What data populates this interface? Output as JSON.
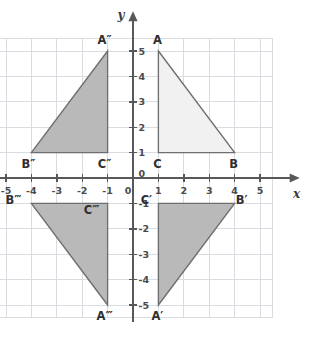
{
  "chart_data": {
    "type": "scatter",
    "title": "",
    "xlabel": "x",
    "ylabel": "y",
    "xlim": [
      -5.5,
      5.5
    ],
    "ylim": [
      -5.5,
      5.5
    ],
    "grid": true,
    "grid_step": 1,
    "legend": "none",
    "x_ticks": [
      "-5",
      "-4",
      "-3",
      "-2",
      "-1",
      "0",
      "1",
      "2",
      "3",
      "4",
      "5"
    ],
    "x_tick_values": [
      -5,
      -4,
      -3,
      -2,
      -1,
      0,
      1,
      2,
      3,
      4,
      5
    ],
    "y_ticks": [
      "-5",
      "-4",
      "-3",
      "-2",
      "-1",
      "0",
      "1",
      "2",
      "3",
      "4",
      "5"
    ],
    "y_tick_values": [
      -5,
      -4,
      -3,
      -2,
      -1,
      0,
      1,
      2,
      3,
      4,
      5
    ],
    "origin_label": "0",
    "shapes": [
      {
        "name": "triangle-abc",
        "role": "original",
        "fill": "#f1f1f1",
        "stroke": "#6e6e70",
        "vertices": [
          {
            "label": "A",
            "x": 1,
            "y": 5,
            "label_dx": -1,
            "label_dy": -7
          },
          {
            "label": "B",
            "x": 4,
            "y": 1,
            "label_dx": -1,
            "label_dy": 15
          },
          {
            "label": "C",
            "x": 1,
            "y": 1,
            "label_dx": -1,
            "label_dy": 15
          }
        ]
      },
      {
        "name": "triangle-a-prime",
        "role": "image",
        "fill": "#b9b9b9",
        "stroke": "#6e6e70",
        "vertices": [
          {
            "label": "A′",
            "x": 1,
            "y": -5,
            "label_dx": -1,
            "label_dy": 15
          },
          {
            "label": "B′",
            "x": 4,
            "y": -1,
            "label_dx": 7,
            "label_dy": 1
          },
          {
            "label": "C′",
            "x": 1,
            "y": -1,
            "label_dx": -12,
            "label_dy": 1
          }
        ]
      },
      {
        "name": "triangle-a-double-prime",
        "role": "image",
        "fill": "#b9b9b9",
        "stroke": "#6e6e70",
        "vertices": [
          {
            "label": "A″",
            "x": -1,
            "y": 5,
            "label_dx": -3,
            "label_dy": -7
          },
          {
            "label": "B″",
            "x": -4,
            "y": 1,
            "label_dx": -3,
            "label_dy": 15
          },
          {
            "label": "C″",
            "x": -1,
            "y": 1,
            "label_dx": -3,
            "label_dy": 15
          }
        ]
      },
      {
        "name": "triangle-a-triple-prime",
        "role": "image",
        "fill": "#b9b9b9",
        "stroke": "#6e6e70",
        "vertices": [
          {
            "label": "A‴",
            "x": -1,
            "y": -5,
            "label_dx": -3,
            "label_dy": 15
          },
          {
            "label": "B‴",
            "x": -4,
            "y": -1,
            "label_dx": -18,
            "label_dy": 1
          },
          {
            "label": "C‴",
            "x": -1,
            "y": -1,
            "label_dx": -16,
            "label_dy": 11
          }
        ]
      }
    ]
  },
  "colors": {
    "grid": "#d9dde2",
    "axis": "#58585a",
    "original_fill": "#f1f1f1",
    "image_fill": "#b9b9b9",
    "outline": "#6e6e70",
    "text": "#2f2f31",
    "background": "#ffffff"
  }
}
